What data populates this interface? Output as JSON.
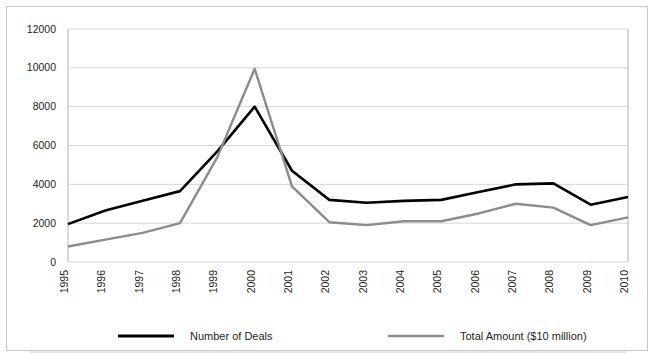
{
  "chart_data": {
    "type": "line",
    "title": "",
    "xlabel": "",
    "ylabel": "",
    "ylim": [
      0,
      12000
    ],
    "ytick_step": 2000,
    "yticks": [
      "0",
      "2000",
      "4000",
      "6000",
      "8000",
      "10000",
      "12000"
    ],
    "grid": true,
    "legend_position": "bottom",
    "categories": [
      "1995",
      "1996",
      "1997",
      "1998",
      "1999",
      "2000",
      "2001",
      "2002",
      "2003",
      "2004",
      "2005",
      "2006",
      "2007",
      "2008",
      "2009",
      "2010"
    ],
    "series": [
      {
        "name": "Number of Deals",
        "color": "#000000",
        "values": [
          1950,
          2650,
          3150,
          3650,
          5700,
          8000,
          4700,
          3200,
          3050,
          3150,
          3200,
          3600,
          4000,
          4050,
          2950,
          3350
        ]
      },
      {
        "name": "Total Amount ($10 million)",
        "color": "#8c8c8c",
        "values": [
          800,
          1150,
          1500,
          2000,
          5400,
          9950,
          3900,
          2050,
          1900,
          2100,
          2100,
          2500,
          3000,
          2800,
          1900,
          2300
        ]
      }
    ]
  },
  "legend": {
    "items": [
      {
        "label": "Number of Deals",
        "color": "#000000"
      },
      {
        "label": "Total Amount ($10 million)",
        "color": "#8c8c8c"
      }
    ]
  },
  "colors": {
    "deals_line": "#000000",
    "amount_line": "#8c8c8c",
    "gridline": "#d7d7d7",
    "frame_border": "#c9c9c9",
    "text": "#231f20",
    "background": "#ffffff"
  }
}
